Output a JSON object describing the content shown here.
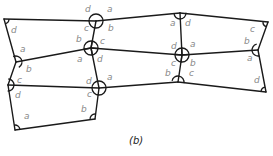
{
  "figure": {
    "caption": "(b)"
  },
  "colors": {
    "line": "#1a1a1a",
    "label": "#888888",
    "background": "#ffffff"
  },
  "vertices": [
    {
      "id": "V1",
      "x": 4,
      "y": 19,
      "marker": "arc"
    },
    {
      "id": "V2",
      "x": 96,
      "y": 21,
      "marker": "circle"
    },
    {
      "id": "V3",
      "x": 180,
      "y": 13,
      "marker": "half-circle"
    },
    {
      "id": "V4",
      "x": 268,
      "y": 22,
      "marker": "arc"
    },
    {
      "id": "V5",
      "x": 16,
      "y": 62,
      "marker": "half-circle"
    },
    {
      "id": "V6",
      "x": 91,
      "y": 48,
      "marker": "circle-cross"
    },
    {
      "id": "V7",
      "x": 182,
      "y": 55,
      "marker": "circle-cross"
    },
    {
      "id": "V8",
      "x": 258,
      "y": 50,
      "marker": "half-circle"
    },
    {
      "id": "V9",
      "x": 8,
      "y": 85,
      "marker": "half-circle"
    },
    {
      "id": "V10",
      "x": 99,
      "y": 88,
      "marker": "circle"
    },
    {
      "id": "V11",
      "x": 178,
      "y": 82,
      "marker": "half-circle"
    },
    {
      "id": "V12",
      "x": 266,
      "y": 92,
      "marker": "arc"
    },
    {
      "id": "V13",
      "x": 15,
      "y": 130,
      "marker": "arc"
    },
    {
      "id": "V14",
      "x": 95,
      "y": 119,
      "marker": "arc"
    }
  ],
  "edges": [
    [
      "V1",
      "V2"
    ],
    [
      "V2",
      "V3"
    ],
    [
      "V3",
      "V4"
    ],
    [
      "V1",
      "V5"
    ],
    [
      "V5",
      "V6"
    ],
    [
      "V6",
      "V7"
    ],
    [
      "V7",
      "V8"
    ],
    [
      "V2",
      "V6"
    ],
    [
      "V3",
      "V7"
    ],
    [
      "V4",
      "V8"
    ],
    [
      "V5",
      "V9"
    ],
    [
      "V9",
      "V10"
    ],
    [
      "V10",
      "V11"
    ],
    [
      "V11",
      "V12"
    ],
    [
      "V6",
      "V10"
    ],
    [
      "V7",
      "V11"
    ],
    [
      "V8",
      "V12"
    ],
    [
      "V9",
      "V13"
    ],
    [
      "V13",
      "V14"
    ],
    [
      "V14",
      "V10"
    ]
  ],
  "angle_labels": [
    {
      "text": "d",
      "x": 11,
      "y": 33
    },
    {
      "text": "d",
      "x": 85,
      "y": 12
    },
    {
      "text": "a",
      "x": 107,
      "y": 12
    },
    {
      "text": "c",
      "x": 84,
      "y": 31
    },
    {
      "text": "b",
      "x": 108,
      "y": 31
    },
    {
      "text": "a",
      "x": 170,
      "y": 26
    },
    {
      "text": "d",
      "x": 185,
      "y": 26
    },
    {
      "text": "c",
      "x": 250,
      "y": 32
    },
    {
      "text": "a",
      "x": 20,
      "y": 52
    },
    {
      "text": "b",
      "x": 26,
      "y": 72
    },
    {
      "text": "b",
      "x": 76,
      "y": 42
    },
    {
      "text": "c",
      "x": 100,
      "y": 44
    },
    {
      "text": "a",
      "x": 77,
      "y": 62
    },
    {
      "text": "d",
      "x": 97,
      "y": 62
    },
    {
      "text": "d",
      "x": 171,
      "y": 49
    },
    {
      "text": "a",
      "x": 190,
      "y": 47
    },
    {
      "text": "c",
      "x": 171,
      "y": 66
    },
    {
      "text": "b",
      "x": 190,
      "y": 66
    },
    {
      "text": "b",
      "x": 244,
      "y": 44
    },
    {
      "text": "a",
      "x": 247,
      "y": 61
    },
    {
      "text": "c",
      "x": 17,
      "y": 83
    },
    {
      "text": "d",
      "x": 15,
      "y": 98
    },
    {
      "text": "b",
      "x": 165,
      "y": 76
    },
    {
      "text": "c",
      "x": 189,
      "y": 76
    },
    {
      "text": "d",
      "x": 86,
      "y": 84
    },
    {
      "text": "a",
      "x": 107,
      "y": 80
    },
    {
      "text": "c",
      "x": 87,
      "y": 97
    },
    {
      "text": "d",
      "x": 254,
      "y": 83
    },
    {
      "text": "b",
      "x": 81,
      "y": 112
    },
    {
      "text": "a",
      "x": 24,
      "y": 119
    }
  ]
}
